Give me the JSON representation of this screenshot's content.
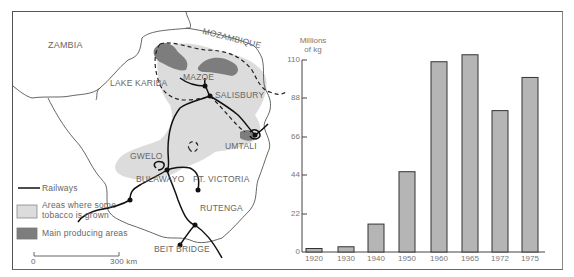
{
  "map": {
    "labels": {
      "zambia": "ZAMBIA",
      "mozambique": "MOZAMBIQUE",
      "lake_kariba": "LAKE KARIBA",
      "mazoe": "MAZOE",
      "salisbury": "SALISBURY",
      "umtali": "UMTALI",
      "gwelo": "GWELO",
      "bulawayo": "BULAWAYO",
      "ft_victoria": "FT. VICTORIA",
      "rutenga": "RUTENGA",
      "beit_bridge": "BEIT BRIDGE"
    },
    "legend": {
      "railways": "Railways",
      "tobacco_line1": "Areas where some",
      "tobacco_line2": "tobacco is grown",
      "main": "Main producing areas"
    },
    "scale": {
      "start": "0",
      "end": "300 km"
    },
    "colors": {
      "light_area": "#d9d9d9",
      "main_area": "#7a7a7a",
      "lines": "#222222"
    }
  },
  "chart_data": {
    "type": "bar",
    "title": "",
    "ylabel_line1": "Millions",
    "ylabel_line2": "of kg",
    "xlabel": "",
    "categories": [
      "1920",
      "1930",
      "1940",
      "1950",
      "1960",
      "1965",
      "1972",
      "1975"
    ],
    "values": [
      2,
      3,
      16,
      46,
      109,
      113,
      81,
      100
    ],
    "yticks": [
      "0",
      "22",
      "44",
      "66",
      "88",
      "110"
    ],
    "ylim": [
      0,
      110
    ],
    "grid": false,
    "bar_color": "#b5b5b5"
  }
}
